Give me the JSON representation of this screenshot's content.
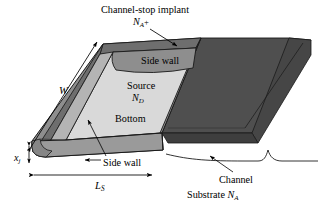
{
  "figure": {
    "kind": "3d-cutaway-cross-section",
    "background_color": "#ffffff",
    "ink_color": "#000000"
  },
  "colors": {
    "substrate_dark": "#4c4c4c",
    "substrate_dark_top": "#555555",
    "substrate_dark_edge": "#3a3a3a",
    "sidewall_gray": "#8e8e8e",
    "sidewall_gray_dark": "#6f6f6f",
    "source_light": "#d6d6d6",
    "bottom_light": "#dedede",
    "outline": "#1a1a1a"
  },
  "labels": {
    "channel_stop_implant": "Channel-stop implant",
    "channel_stop_doping": {
      "symbol": "N",
      "sub": "A",
      "sup": "+"
    },
    "side_wall_top": "Side wall",
    "side_wall_bottom": "Side wall",
    "source": "Source",
    "source_doping": {
      "symbol": "N",
      "sub": "D"
    },
    "bottom": "Bottom",
    "channel": "Channel",
    "substrate": "Substrate",
    "substrate_doping": {
      "symbol": "N",
      "sub": "A"
    }
  },
  "dimensions": [
    {
      "name": "width",
      "symbol": "W",
      "sub": "",
      "orientation": "diagonal-left",
      "arrow": "double"
    },
    {
      "name": "junction-depth",
      "symbol": "x",
      "sub": "j",
      "orientation": "vertical-left",
      "arrow": "double"
    },
    {
      "name": "source-length",
      "symbol": "L",
      "sub": "S",
      "orientation": "horizontal-bottom",
      "arrow": "double"
    }
  ],
  "leaders": [
    {
      "from": "channel-stop-implant",
      "to": "top-back-rim",
      "style": "arrow"
    },
    {
      "from": "side-wall-bottom",
      "to": "inner-left-wall",
      "style": "arrow"
    },
    {
      "from": "side-wall-bottom",
      "to": "front-wall-left",
      "style": "arrow"
    },
    {
      "from": "channel",
      "to": "channel-surface",
      "style": "arrow"
    },
    {
      "from": "substrate-bracket",
      "to": "right-edge",
      "style": "bracket"
    }
  ]
}
